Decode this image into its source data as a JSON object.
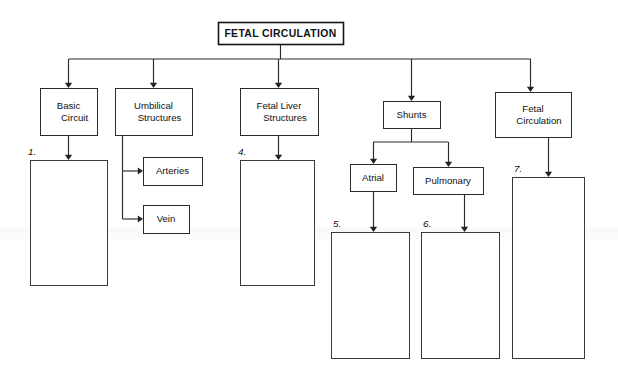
{
  "worksheet": {
    "title": "FETAL CIRCULATION",
    "width": 618,
    "height": 380,
    "colors": {
      "background": "#ffffff",
      "box_stroke": "#2b2b2b",
      "connector": "#2b2b2b",
      "text": "#111111"
    }
  },
  "title_box": {
    "label": "FETAL CIRCULATION",
    "x": 218,
    "y": 22,
    "w": 125,
    "h": 22
  },
  "nodes": [
    {
      "id": "basic-circuit",
      "lines": [
        "Basic",
        "Circuit"
      ],
      "x": 40,
      "y": 88,
      "w": 57,
      "h": 47
    },
    {
      "id": "umbilical-structures",
      "lines": [
        "Umbilical",
        "Structures"
      ],
      "x": 115,
      "y": 88,
      "w": 77,
      "h": 47
    },
    {
      "id": "fetal-liver-structures",
      "lines": [
        "Fetal Liver",
        "Structures"
      ],
      "x": 240,
      "y": 88,
      "w": 78,
      "h": 47
    },
    {
      "id": "shunts",
      "lines": [
        "Shunts"
      ],
      "x": 383,
      "y": 101,
      "w": 57,
      "h": 27
    },
    {
      "id": "fetal-circulation-branch",
      "lines": [
        "Fetal",
        "Circulation"
      ],
      "x": 495,
      "y": 92,
      "w": 76,
      "h": 45
    },
    {
      "id": "arteries",
      "lines": [
        "Arteries"
      ],
      "x": 143,
      "y": 157,
      "w": 59,
      "h": 28
    },
    {
      "id": "vein",
      "lines": [
        "Vein"
      ],
      "x": 143,
      "y": 205,
      "w": 46,
      "h": 28
    },
    {
      "id": "atrial",
      "lines": [
        "Atrial"
      ],
      "x": 350,
      "y": 164,
      "w": 46,
      "h": 27
    },
    {
      "id": "pulmonary",
      "lines": [
        "Pulmonary"
      ],
      "x": 413,
      "y": 167,
      "w": 70,
      "h": 27
    }
  ],
  "answer_boxes": [
    {
      "id": "answer-1",
      "number": "1.",
      "x": 30,
      "y": 160,
      "w": 77,
      "h": 125,
      "num_x": 28,
      "num_y": 155
    },
    {
      "id": "answer-4",
      "number": "4.",
      "x": 240,
      "y": 160,
      "w": 74,
      "h": 125,
      "num_x": 238,
      "num_y": 155
    },
    {
      "id": "answer-5",
      "number": "5.",
      "x": 331,
      "y": 232,
      "w": 78,
      "h": 126,
      "num_x": 333,
      "num_y": 227
    },
    {
      "id": "answer-6",
      "number": "6.",
      "x": 421,
      "y": 232,
      "w": 78,
      "h": 126,
      "num_x": 423,
      "num_y": 227
    },
    {
      "id": "answer-7",
      "number": "7.",
      "x": 512,
      "y": 177,
      "w": 72,
      "h": 181,
      "num_x": 514,
      "num_y": 172
    }
  ],
  "connectors": {
    "title_stem": "M280.5,44 L280.5,59",
    "main_bus": "M68.5,59 L531,59",
    "drops": [
      {
        "id": "drop-basic-circuit",
        "path": "M68.5,59 L68.5,84",
        "arrow_x": 68.5,
        "arrow_y": 88
      },
      {
        "id": "drop-umbilical",
        "path": "M153.5,59 L153.5,84",
        "arrow_x": 153.5,
        "arrow_y": 88
      },
      {
        "id": "drop-fetal-liver",
        "path": "M278.5,59 L278.5,84",
        "arrow_x": 278.5,
        "arrow_y": 88
      },
      {
        "id": "drop-shunts",
        "path": "M411.5,59 L411.5,97",
        "arrow_x": 411.5,
        "arrow_y": 101
      },
      {
        "id": "drop-fetal-circulation",
        "path": "M530.5,59 L530.5,88",
        "arrow_x": 530.5,
        "arrow_y": 92
      }
    ],
    "umbilical_spine": "M122.5,135 L122.5,219",
    "umbilical_branches": [
      {
        "id": "branch-arteries",
        "path": "M122.5,171 L139,171",
        "arrow_x": 143,
        "arrow_y": 171,
        "dir": "right"
      },
      {
        "id": "branch-vein",
        "path": "M122.5,219 L139,219",
        "arrow_x": 143,
        "arrow_y": 219,
        "dir": "right"
      }
    ],
    "shunts_stem": "M411.5,128 L411.5,142",
    "shunts_bus": "M373,142 L448.5,142",
    "shunts_drops": [
      {
        "id": "drop-atrial",
        "path": "M373.5,142 L373.5,160",
        "arrow_x": 373.5,
        "arrow_y": 164
      },
      {
        "id": "drop-pulmonary",
        "path": "M448.5,142 L448.5,163",
        "arrow_x": 448.5,
        "arrow_y": 167
      }
    ],
    "answer_arrows": [
      {
        "id": "arrow-to-answer-1",
        "path": "M68.5,135 L68.5,156",
        "arrow_x": 68.5,
        "arrow_y": 160
      },
      {
        "id": "arrow-to-answer-4",
        "path": "M278.5,135 L278.5,156",
        "arrow_x": 278.5,
        "arrow_y": 160
      },
      {
        "id": "arrow-to-answer-5",
        "path": "M373.5,191 L373.5,228",
        "arrow_x": 373.5,
        "arrow_y": 232
      },
      {
        "id": "arrow-to-answer-6",
        "path": "M464.5,194 L464.5,228",
        "arrow_x": 464.5,
        "arrow_y": 232
      },
      {
        "id": "arrow-to-answer-7",
        "path": "M548.5,137 L548.5,173",
        "arrow_x": 548.5,
        "arrow_y": 177
      }
    ]
  }
}
